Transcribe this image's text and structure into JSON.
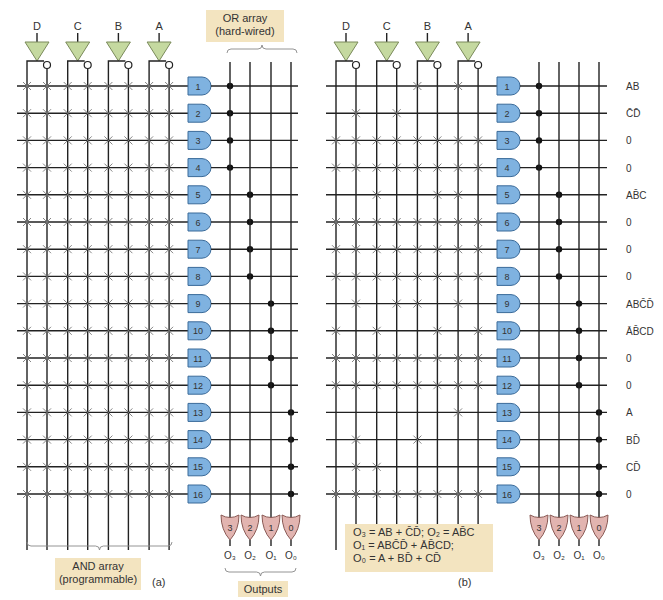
{
  "figure": {
    "panels": [
      {
        "id": "a",
        "caption": "(a)",
        "inputs": [
          "D",
          "C",
          "B",
          "A"
        ],
        "and_array_label": [
          "AND array",
          "(programmable)"
        ],
        "or_array_label": [
          "OR array",
          "(hard-wired)"
        ],
        "outputs_label": "Outputs",
        "fuse_map": "all-intact"
      },
      {
        "id": "b",
        "caption": "(b)",
        "inputs": [
          "D",
          "C",
          "B",
          "A"
        ],
        "product_terms": [
          "AB",
          "C̄D̄",
          "0",
          "0",
          "AB̄C",
          "0",
          "0",
          "0",
          "ABC̄D̄",
          "ĀB̄CD",
          "0",
          "0",
          "A",
          "BD̄",
          "CD̄",
          "0"
        ],
        "equations": [
          "O₃ = AB + C̄D̄; O₂ = AB̄C",
          "O₁ = ABC̄D̄ + ĀB̄CD;",
          "O₀ = A + BD̄ + CD̄"
        ]
      }
    ],
    "and_gates": [
      "1",
      "2",
      "3",
      "4",
      "5",
      "6",
      "7",
      "8",
      "9",
      "10",
      "11",
      "12",
      "13",
      "14",
      "15",
      "16"
    ],
    "or_gates": [
      "3",
      "2",
      "1",
      "0"
    ],
    "output_names": [
      "O₃",
      "O₂",
      "O₁",
      "O₀"
    ],
    "column_order": [
      "D",
      "D̄",
      "C",
      "C̄",
      "B",
      "B̄",
      "A",
      "Ā"
    ],
    "programmed_fuses_b": [
      [
        4,
        6
      ],
      [
        1,
        3
      ],
      [
        0,
        1,
        2,
        3,
        4,
        5,
        6,
        7
      ],
      [
        0,
        1,
        2,
        3,
        4,
        5,
        6,
        7
      ],
      [
        2,
        5,
        6
      ],
      [
        0,
        1,
        2,
        3,
        4,
        5,
        6,
        7
      ],
      [
        0,
        1,
        2,
        3,
        4,
        5,
        6,
        7
      ],
      [
        0,
        1,
        2,
        3,
        4,
        5,
        6,
        7
      ],
      [
        1,
        3,
        4,
        6
      ],
      [
        0,
        2,
        5,
        7
      ],
      [
        0,
        1,
        2,
        3,
        4,
        5,
        6,
        7
      ],
      [
        0,
        1,
        2,
        3,
        4,
        5,
        6,
        7
      ],
      [
        6
      ],
      [
        1,
        4
      ],
      [
        1,
        2
      ],
      [
        0,
        1,
        2,
        3,
        4,
        5,
        6,
        7
      ]
    ],
    "colors": {
      "and_gate": "#7fb2e0",
      "or_gate": "#e2b4b0",
      "buffer": "#c5d9a0",
      "label_bg": "#f3e4c0",
      "line": "#222222"
    }
  }
}
